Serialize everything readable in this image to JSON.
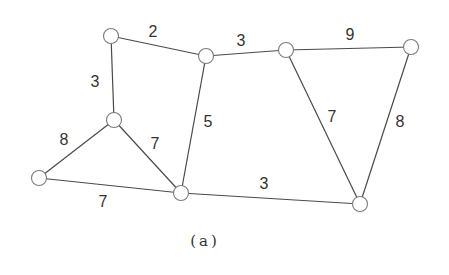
{
  "figure": {
    "caption": "(a)",
    "colors": {
      "edge": "#4a4a4a",
      "node_stroke": "#7a7a7a",
      "node_fill": "#ffffff",
      "text": "#333333"
    },
    "nodes": [
      {
        "id": "A",
        "x": 111,
        "y": 36
      },
      {
        "id": "B",
        "x": 206,
        "y": 56
      },
      {
        "id": "C",
        "x": 286,
        "y": 50
      },
      {
        "id": "D",
        "x": 411,
        "y": 47
      },
      {
        "id": "E",
        "x": 114,
        "y": 120
      },
      {
        "id": "F",
        "x": 39,
        "y": 178
      },
      {
        "id": "G",
        "x": 181,
        "y": 193
      },
      {
        "id": "H",
        "x": 360,
        "y": 204
      }
    ],
    "edges": [
      {
        "from": "A",
        "to": "B",
        "weight": "2",
        "lx": 153,
        "ly": 31
      },
      {
        "from": "B",
        "to": "C",
        "weight": "3",
        "lx": 241,
        "ly": 40
      },
      {
        "from": "C",
        "to": "D",
        "weight": "9",
        "lx": 350,
        "ly": 34
      },
      {
        "from": "A",
        "to": "E",
        "weight": "3",
        "lx": 95,
        "ly": 81
      },
      {
        "from": "B",
        "to": "G",
        "weight": "5",
        "lx": 208,
        "ly": 121
      },
      {
        "from": "C",
        "to": "H",
        "weight": "7",
        "lx": 332,
        "ly": 116
      },
      {
        "from": "D",
        "to": "H",
        "weight": "8",
        "lx": 400,
        "ly": 121
      },
      {
        "from": "E",
        "to": "F",
        "weight": "8",
        "lx": 64,
        "ly": 139
      },
      {
        "from": "E",
        "to": "G",
        "weight": "7",
        "lx": 155,
        "ly": 143
      },
      {
        "from": "F",
        "to": "G",
        "weight": "7",
        "lx": 103,
        "ly": 201
      },
      {
        "from": "G",
        "to": "H",
        "weight": "3",
        "lx": 264,
        "ly": 183
      }
    ],
    "node_radius": 7.5
  }
}
